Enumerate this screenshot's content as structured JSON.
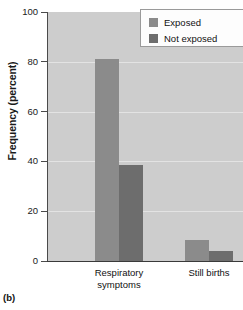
{
  "figure": {
    "panel_caption": "(b)"
  },
  "chart_data": {
    "type": "bar",
    "title": "",
    "xlabel": "",
    "ylabel": "Frequency (percent)",
    "ylim": [
      0,
      100
    ],
    "yticks": [
      0,
      20,
      40,
      60,
      80,
      100
    ],
    "ytick_labels": [
      "0",
      "20",
      "40",
      "60",
      "80",
      "100"
    ],
    "grid": true,
    "grid_axis": "y",
    "categories": [
      "Respiratory\nsymptoms",
      "Still births"
    ],
    "category_labels_flat": [
      "Respiratory symptoms",
      "Still births"
    ],
    "series": [
      {
        "name": "Exposed",
        "color": "#8b8b8b",
        "values": [
          81,
          8.5
        ]
      },
      {
        "name": "Not exposed",
        "color": "#6d6d6d",
        "values": [
          38.5,
          4
        ]
      }
    ],
    "legend": {
      "position": "top-right",
      "entries": [
        "Exposed",
        "Not exposed"
      ]
    },
    "plot_background": "#cdcdcd",
    "page_background": "#ffffff"
  }
}
